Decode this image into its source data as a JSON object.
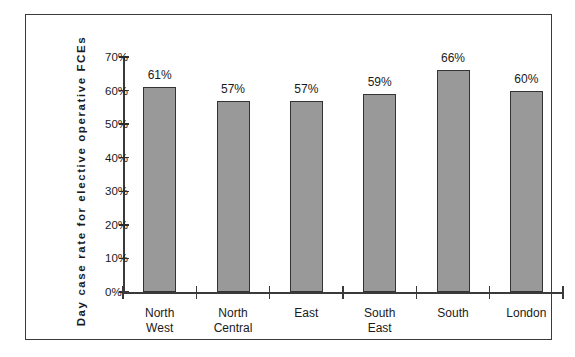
{
  "chart_data": {
    "type": "bar",
    "title": "",
    "xlabel": "",
    "ylabel": "Day case rate for elective operative FCEs",
    "categories": [
      "North West",
      "North Central",
      "East",
      "South East",
      "South",
      "London"
    ],
    "category_lines": [
      [
        "North",
        "West"
      ],
      [
        "North",
        "Central"
      ],
      [
        "East",
        ""
      ],
      [
        "South",
        "East"
      ],
      [
        "South",
        ""
      ],
      [
        "London",
        ""
      ]
    ],
    "values": [
      61,
      57,
      57,
      59,
      66,
      60
    ],
    "value_labels": [
      "61%",
      "57%",
      "57%",
      "59%",
      "66%",
      "60%"
    ],
    "ylim": [
      0,
      70
    ],
    "ytick_values": [
      0,
      10,
      20,
      30,
      40,
      50,
      60,
      70
    ],
    "ytick_labels": [
      "0%",
      "10%",
      "20%",
      "30%",
      "40%",
      "50%",
      "60%",
      "70%"
    ],
    "grid": false,
    "legend": null,
    "bar_color": "#999999",
    "bar_border_color": "#333333",
    "axis_color": "#3a3a3a",
    "background": "#ffffff"
  }
}
